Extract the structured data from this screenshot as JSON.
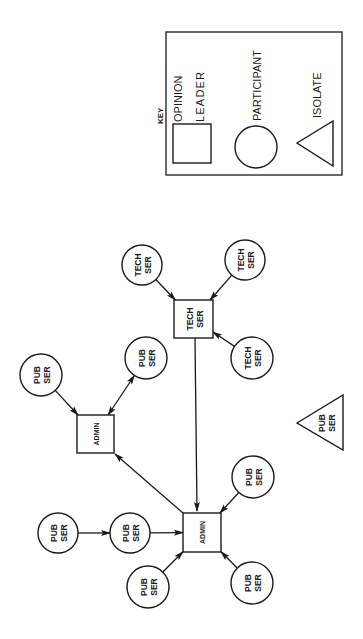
{
  "diagram": {
    "orientation": "rotated-90-ccw",
    "key": {
      "title": "KEY",
      "box": {
        "x": 166,
        "y": 32,
        "w": 176,
        "h": 143
      },
      "items": [
        {
          "shape": "square",
          "label_line1": "OPINION",
          "label_line2": "LEADER",
          "x": 173,
          "y": 124,
          "w": 38,
          "h": 39
        },
        {
          "shape": "circle",
          "label": "PARTICIPANT",
          "cx": 256,
          "cy": 147,
          "r": 21
        },
        {
          "shape": "triangle",
          "label": "ISOLATE",
          "points": "297,143 333,121 333,166"
        }
      ]
    },
    "nodes": [
      {
        "id": "tech-leader",
        "shape": "square",
        "role": "opinion-leader",
        "line1": "TECH",
        "line2": "SER",
        "x": 174,
        "y": 300,
        "w": 39,
        "h": 38
      },
      {
        "id": "tech-1",
        "shape": "circle",
        "role": "participant",
        "line1": "TECH",
        "line2": "SER",
        "cx": 142,
        "cy": 265,
        "r": 20
      },
      {
        "id": "tech-2",
        "shape": "circle",
        "role": "participant",
        "line1": "TECH",
        "line2": "SER",
        "cx": 245,
        "cy": 260,
        "r": 20
      },
      {
        "id": "tech-3",
        "shape": "circle",
        "role": "participant",
        "line1": "TECH",
        "line2": "SER",
        "cx": 252,
        "cy": 358,
        "r": 21
      },
      {
        "id": "admin-top",
        "shape": "square",
        "role": "opinion-leader",
        "line1": "ADMIN",
        "line2": "",
        "x": 77,
        "y": 415,
        "w": 37,
        "h": 38
      },
      {
        "id": "pub-1",
        "shape": "circle",
        "role": "participant",
        "line1": "PUB",
        "line2": "SER",
        "cx": 41,
        "cy": 375,
        "r": 21
      },
      {
        "id": "pub-2",
        "shape": "circle",
        "role": "participant",
        "line1": "PUB",
        "line2": "SER",
        "cx": 146,
        "cy": 358,
        "r": 21
      },
      {
        "id": "admin-bottom",
        "shape": "square",
        "role": "opinion-leader",
        "line1": "ADMIN",
        "line2": "",
        "x": 183,
        "y": 513,
        "w": 38,
        "h": 39
      },
      {
        "id": "pub-3",
        "shape": "circle",
        "role": "participant",
        "line1": "PUB",
        "line2": "SER",
        "cx": 58,
        "cy": 533,
        "r": 20
      },
      {
        "id": "pub-4",
        "shape": "circle",
        "role": "participant",
        "line1": "PUB",
        "line2": "SER",
        "cx": 130,
        "cy": 533,
        "r": 20
      },
      {
        "id": "pub-5",
        "shape": "circle",
        "role": "participant",
        "line1": "PUB",
        "line2": "SER",
        "cx": 148,
        "cy": 587,
        "r": 21
      },
      {
        "id": "pub-6",
        "shape": "circle",
        "role": "participant",
        "line1": "PUB",
        "line2": "SER",
        "cx": 252,
        "cy": 583,
        "r": 21
      },
      {
        "id": "pub-7",
        "shape": "circle",
        "role": "participant",
        "line1": "PUB",
        "line2": "SER",
        "cx": 253,
        "cy": 477,
        "r": 21
      },
      {
        "id": "pub-isolate",
        "shape": "triangle",
        "role": "isolate",
        "line1": "PUB",
        "line2": "SER",
        "points": "297,423 343,395 343,450"
      }
    ],
    "edges": [
      {
        "from": "tech-1",
        "to": "tech-leader",
        "type": "arrow"
      },
      {
        "from": "tech-2",
        "to": "tech-leader",
        "type": "arrow"
      },
      {
        "from": "tech-3",
        "to": "tech-leader",
        "type": "arrow"
      },
      {
        "from": "tech-leader",
        "to": "admin-bottom",
        "type": "arrow"
      },
      {
        "from": "pub-1",
        "to": "admin-top",
        "type": "arrow"
      },
      {
        "from": "pub-2",
        "to": "admin-top",
        "type": "double-arrow"
      },
      {
        "from": "admin-bottom",
        "to": "admin-top",
        "type": "arrow"
      },
      {
        "from": "pub-3",
        "to": "pub-4",
        "type": "arrow"
      },
      {
        "from": "pub-4",
        "to": "admin-bottom",
        "type": "arrow"
      },
      {
        "from": "pub-5",
        "to": "admin-bottom",
        "type": "arrow"
      },
      {
        "from": "pub-6",
        "to": "admin-bottom",
        "type": "arrow"
      },
      {
        "from": "pub-7",
        "to": "admin-bottom",
        "type": "arrow"
      }
    ]
  }
}
